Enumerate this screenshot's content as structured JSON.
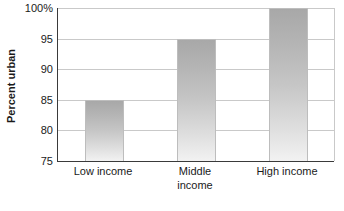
{
  "chart_data": {
    "type": "bar",
    "title": "",
    "subtitle": "",
    "xlabel": "",
    "ylabel": "Percent urban",
    "categories": [
      "Low income",
      "Middle income",
      "High income"
    ],
    "values": [
      85,
      95,
      100
    ],
    "ylim": [
      75,
      100
    ],
    "yticks": [
      75,
      80,
      85,
      90,
      95,
      100
    ],
    "ytick_labels": [
      "75",
      "80",
      "85",
      "90",
      "95",
      "100%"
    ],
    "grid": "horizontal",
    "legend": "none",
    "series": [
      {
        "name": "Percent urban",
        "values": [
          85,
          95,
          100
        ]
      }
    ],
    "bar_color_top": "#a8a8a8",
    "bar_color_bottom": "#f2f2f2",
    "bar_border_color": "#bdbdbd",
    "gridline_color": "#c9c9c9",
    "axis_color": "#3a3a3a",
    "background_color": "#ffffff",
    "text_color": "#1a1a1a"
  },
  "axis": {
    "y_title": "Percent urban",
    "ticks": [
      {
        "value": 100,
        "label": "100%"
      },
      {
        "value": 95,
        "label": "95"
      },
      {
        "value": 90,
        "label": "90"
      },
      {
        "value": 85,
        "label": "85"
      },
      {
        "value": 80,
        "label": "80"
      },
      {
        "value": 75,
        "label": "75"
      }
    ]
  },
  "bars": [
    {
      "label": "Low income",
      "value": 85,
      "label_lines": "Low income"
    },
    {
      "label": "Middle income",
      "value": 95,
      "label_lines": "Middle\nincome"
    },
    {
      "label": "High income",
      "value": 100,
      "label_lines": "High income"
    }
  ]
}
